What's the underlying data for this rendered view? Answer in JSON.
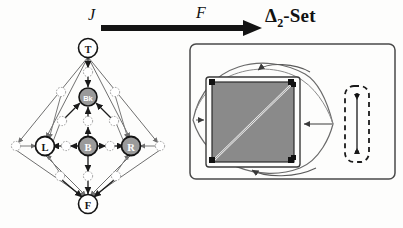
{
  "figure": {
    "title_left": "J",
    "arrow_label": "F",
    "title_right_prefix": "Δ",
    "title_right_sub": "2",
    "title_right_suffix": "-Set",
    "colors": {
      "ink": "#1a1a1a",
      "node_fill": "#9a9a9a",
      "node_text": "#ffffff",
      "square_fill": "#8a8a8a",
      "square_frame": "#efefef",
      "paper": "#fdfdfc",
      "faint": "#a8a8a8"
    }
  },
  "lattice": {
    "name": "face-lattice-poset",
    "major_nodes": [
      {
        "id": "T",
        "label": "T",
        "x": 88,
        "y": 48,
        "r": 9.5
      },
      {
        "id": "Bk",
        "label": "Bk",
        "x": 88,
        "y": 97,
        "r": 9.0
      },
      {
        "id": "L",
        "label": "L",
        "x": 45,
        "y": 146,
        "r": 9.5
      },
      {
        "id": "B",
        "label": "B",
        "x": 88,
        "y": 146,
        "r": 9.5
      },
      {
        "id": "R",
        "label": "R",
        "x": 131,
        "y": 146,
        "r": 9.5
      },
      {
        "id": "F",
        "label": "F",
        "x": 88,
        "y": 204,
        "r": 9.5
      }
    ],
    "minor_nodes": [
      {
        "id": "m1",
        "x": 88,
        "y": 72
      },
      {
        "id": "m2",
        "x": 61,
        "y": 92
      },
      {
        "id": "m3",
        "x": 115,
        "y": 92
      },
      {
        "id": "m4",
        "x": 62,
        "y": 121
      },
      {
        "id": "m5",
        "x": 88,
        "y": 121
      },
      {
        "id": "m6",
        "x": 114,
        "y": 121
      },
      {
        "id": "m7",
        "x": 16,
        "y": 146
      },
      {
        "id": "m8",
        "x": 66,
        "y": 146
      },
      {
        "id": "m9",
        "x": 110,
        "y": 146
      },
      {
        "id": "m10",
        "x": 160,
        "y": 146
      },
      {
        "id": "m11",
        "x": 60,
        "y": 176
      },
      {
        "id": "m12",
        "x": 88,
        "y": 176
      },
      {
        "id": "m13",
        "x": 116,
        "y": 176
      }
    ],
    "strong_edges": [
      [
        "T",
        "m1"
      ],
      [
        "m1",
        "Bk"
      ],
      [
        "m2",
        "Bk"
      ],
      [
        "m3",
        "Bk"
      ],
      [
        "m4",
        "Bk"
      ],
      [
        "m5",
        "Bk"
      ],
      [
        "m6",
        "Bk"
      ],
      [
        "m8",
        "L"
      ],
      [
        "m9",
        "R"
      ],
      [
        "m5",
        "B"
      ],
      [
        "m12",
        "B"
      ],
      [
        "m11",
        "F"
      ],
      [
        "m12",
        "F"
      ],
      [
        "m13",
        "F"
      ],
      [
        "B",
        "m8"
      ],
      [
        "B",
        "m9"
      ]
    ],
    "outline_edges": [
      [
        "T",
        "L"
      ],
      [
        "T",
        "R"
      ],
      [
        "T",
        "m7"
      ],
      [
        "T",
        "m10"
      ],
      [
        "L",
        "F"
      ],
      [
        "R",
        "F"
      ],
      [
        "m7",
        "F"
      ],
      [
        "m10",
        "F"
      ],
      [
        "m2",
        "L"
      ],
      [
        "m3",
        "R"
      ],
      [
        "m11",
        "L"
      ],
      [
        "m13",
        "R"
      ],
      [
        "m4",
        "L"
      ],
      [
        "m6",
        "R"
      ],
      [
        "m7",
        "L"
      ],
      [
        "m10",
        "R"
      ]
    ]
  },
  "delta_set": {
    "name": "delta-2-set-panel",
    "outer_box": {
      "x": 190,
      "y": 44,
      "w": 205,
      "h": 135,
      "rx": 6
    },
    "square": {
      "x": 212,
      "y": 82,
      "w": 82,
      "h": 80
    },
    "square_diagonal": "bottom-left to top-right",
    "corner_dots": 4,
    "lens": {
      "left_tip_x": 193,
      "right_tip_x": 333,
      "cy": 124
    },
    "dashed_box": {
      "x": 345,
      "y": 86,
      "w": 24,
      "h": 76,
      "rx": 9
    },
    "simplex_segment": {
      "x": 357,
      "y_top": 96,
      "y_bottom": 152,
      "endpoints": 2
    },
    "arrows": [
      {
        "name": "arrow-into-top-edge",
        "target": "square-top"
      },
      {
        "name": "arrow-into-bottom-edge",
        "target": "square-bottom"
      },
      {
        "name": "arrow-into-left-edge",
        "target": "square-left"
      },
      {
        "name": "arrow-from-lens-tip",
        "target": "square-right"
      }
    ]
  }
}
